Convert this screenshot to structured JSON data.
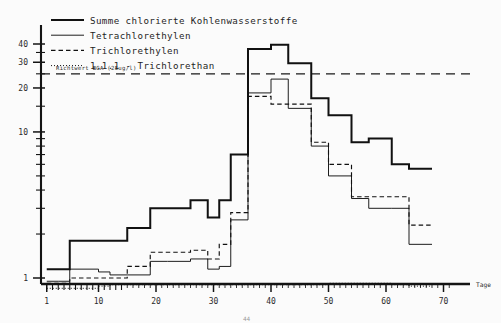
{
  "figure": {
    "background": "#fbfbfb",
    "ink": "#1a1a1a",
    "page_label": "44"
  },
  "legend": {
    "position": "top-left",
    "entries": [
      {
        "label": "Summe chlorierte Kohlenwasserstoffe",
        "style": "thick-solid",
        "color": "#111111"
      },
      {
        "label": "Tetrachlorethylen",
        "style": "thin-solid",
        "color": "#111111"
      },
      {
        "label": "Trichlorethylen",
        "style": "dashed",
        "color": "#111111"
      },
      {
        "label": "1.1.1 - Trichlorethan",
        "style": "dotted",
        "color": "#111111"
      }
    ]
  },
  "annotation": {
    "guideline_label": "Richtwert BGA (25ug/l)",
    "guideline_value": 25,
    "guideline_style": "dashed"
  },
  "axes": {
    "x_title": "Tage",
    "x_ticks": [
      "1",
      "10",
      "20",
      "30",
      "40",
      "50",
      "60",
      "70"
    ],
    "y_ticks": [
      "1",
      "10",
      "20",
      "30",
      "40"
    ]
  },
  "chart_data": {
    "type": "line",
    "title": "",
    "subtitle": "",
    "xlabel": "Tage",
    "ylabel": "",
    "xlim": [
      0,
      72
    ],
    "ylim": [
      0.8,
      46
    ],
    "yscale": "log",
    "grid": false,
    "legend_position": "top-left",
    "drawstyle": "steps-post",
    "annotations": [
      {
        "type": "hline",
        "value": 25,
        "label": "Richtwert BGA (25ug/l)",
        "style": "dashed"
      }
    ],
    "x": [
      1,
      3,
      5,
      8,
      10,
      12,
      15,
      19,
      22,
      26,
      29,
      31,
      33,
      36,
      40,
      43,
      47,
      50,
      54,
      57,
      61,
      64,
      68
    ],
    "series": [
      {
        "name": "Summe chlorierte Kohlenwasserstoffe",
        "style": "thick-solid",
        "values": [
          1.15,
          1.15,
          1.8,
          1.8,
          1.8,
          1.8,
          2.2,
          3.0,
          3.0,
          3.4,
          2.6,
          3.4,
          7.0,
          37.0,
          39.5,
          29.5,
          17.0,
          13.0,
          8.5,
          9.0,
          6.0,
          5.6,
          5.6
        ]
      },
      {
        "name": "Tetrachlorethylen",
        "style": "thin-solid",
        "values": [
          0.95,
          0.95,
          1.15,
          1.15,
          1.1,
          1.05,
          1.05,
          1.3,
          1.3,
          1.35,
          1.15,
          1.2,
          2.5,
          18.5,
          23.0,
          14.5,
          8.0,
          5.0,
          3.5,
          3.0,
          3.0,
          1.7,
          1.7
        ]
      },
      {
        "name": "Trichlorethylen",
        "style": "dashed",
        "values": [
          0.92,
          0.92,
          1.0,
          1.0,
          1.0,
          1.0,
          1.2,
          1.5,
          1.5,
          1.55,
          1.35,
          1.7,
          2.8,
          17.5,
          15.5,
          15.5,
          8.5,
          6.0,
          3.6,
          3.6,
          3.6,
          2.3,
          2.3
        ]
      },
      {
        "name": "1.1.1 - Trichlorethan",
        "style": "dotted",
        "values": [
          0.85,
          0.85,
          0.85,
          0.85,
          0.88,
          0.9,
          0.9,
          0.9,
          0.9,
          0.9,
          0.9,
          0.9,
          0.9,
          0.9,
          0.9,
          0.9,
          0.9,
          0.92,
          0.92,
          0.92,
          0.9,
          0.88,
          0.88
        ]
      }
    ]
  }
}
